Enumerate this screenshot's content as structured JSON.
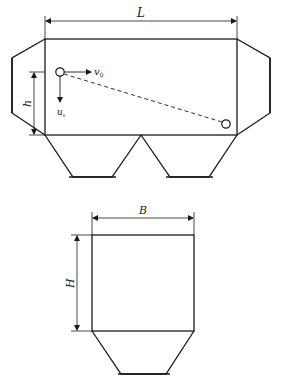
{
  "diagram": {
    "side_view": {
      "length_label": "L",
      "height_label": "h",
      "horizontal_velocity_label": "v",
      "horizontal_velocity_sub": "0",
      "settling_velocity_label": "u",
      "settling_velocity_sub": "s"
    },
    "front_view": {
      "width_label": "B",
      "height_label": "H"
    },
    "colors": {
      "line": "#1a1a1a",
      "background": "#ffffff"
    }
  }
}
